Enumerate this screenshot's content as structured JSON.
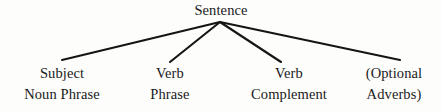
{
  "diagram": {
    "type": "tree",
    "title": "Sentence",
    "orientation": "top-down",
    "colors": {
      "background": "#fdfdfb",
      "text": "#1a1a1a",
      "edge": "#151515"
    },
    "root": {
      "label": "Sentence",
      "apex": {
        "x": 220,
        "y": 22
      }
    },
    "edges": [
      {
        "name": "edge-to-subject-noun-phrase",
        "x1": 220,
        "y1": 22,
        "x2": 62,
        "y2": 60
      },
      {
        "name": "edge-to-verb-phrase",
        "x1": 220,
        "y1": 22,
        "x2": 170,
        "y2": 62
      },
      {
        "name": "edge-to-verb-complement",
        "x1": 220,
        "y1": 22,
        "x2": 281,
        "y2": 62
      },
      {
        "name": "edge-to-optional-adverbs",
        "x1": 220,
        "y1": 22,
        "x2": 400,
        "y2": 60
      }
    ],
    "leaves": [
      {
        "name": "subject-noun-phrase",
        "line1": "Subject",
        "line2": "Noun Phrase"
      },
      {
        "name": "verb-phrase",
        "line1": "Verb",
        "line2": "Phrase"
      },
      {
        "name": "verb-complement",
        "line1": "Verb",
        "line2": "Complement"
      },
      {
        "name": "optional-adverbs",
        "line1": "(Optional",
        "line2": "Adverbs)"
      }
    ]
  }
}
